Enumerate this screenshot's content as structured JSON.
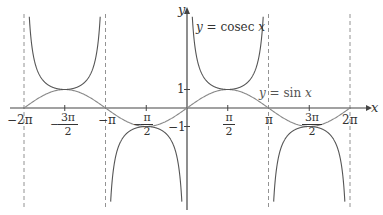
{
  "chart_data": {
    "type": "line",
    "title": "",
    "xlabel": "x",
    "ylabel": "y",
    "xlim": [
      -6.2832,
      6.2832
    ],
    "ylim": [
      -5,
      5
    ],
    "grid": false,
    "x_ticks": [
      "-2π",
      "-3π/2",
      "-π",
      "-π/2",
      "π/2",
      "π",
      "3π/2",
      "2π"
    ],
    "y_ticks": [
      "1",
      "-1"
    ],
    "asymptotes_x": [
      "-2π",
      "-π",
      "π",
      "2π"
    ],
    "series": [
      {
        "name": "y = cosec x",
        "function": "1/sin(x)",
        "domain": [
          -6.2832,
          6.2832
        ],
        "color": "#555555"
      },
      {
        "name": "y = sin x",
        "function": "sin(x)",
        "domain": [
          -6.2832,
          6.2832
        ],
        "color": "#888888"
      }
    ],
    "annotations": [
      {
        "text": "y = cosec x",
        "near": "upper branch right of y-axis"
      },
      {
        "text": "y = sin x",
        "near": "x ≈ 2.5, y ≈ 0.8"
      }
    ]
  },
  "labels": {
    "x_axis": "x",
    "y_axis": "y",
    "cosec_label_y": "y",
    "cosec_label_eq": " = cosec ",
    "cosec_label_x": "x",
    "sin_label_y": "y",
    "sin_label_eq": " = sin ",
    "sin_label_x": "x",
    "tick_neg2pi": "−2π",
    "tick_negpi": "−π",
    "tick_pi": "π",
    "tick_2pi": "2π",
    "tick_3pi_num": "3π",
    "tick_pi_num": "π",
    "tick_den": "2",
    "minus": "−",
    "tick_y1": "1",
    "tick_yneg1": "−1"
  }
}
